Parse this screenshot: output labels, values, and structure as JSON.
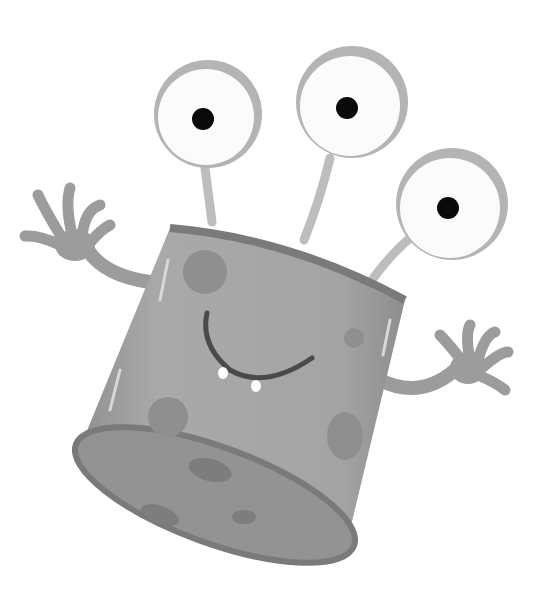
{
  "image": {
    "subject": "cartoon three-eyed cylinder monster",
    "style": "grayscale illustration",
    "background": "#ffffff",
    "colors": {
      "body": "#a6a6a6",
      "body_dark": "#8a8a8a",
      "rim": "#7a7a7a",
      "bottom": "#939393",
      "spot": "#8f8f8f",
      "eye_white": "#fbfbfb",
      "eye_ring": "#b4b4b4",
      "pupil": "#0a0a0a",
      "stalk": "#bdbdbd",
      "arm": "#9c9c9c",
      "mouth": "#4a4a4a",
      "tooth": "#ffffff"
    },
    "features": {
      "eyes": 3,
      "arms": 2,
      "teeth": 2
    }
  }
}
